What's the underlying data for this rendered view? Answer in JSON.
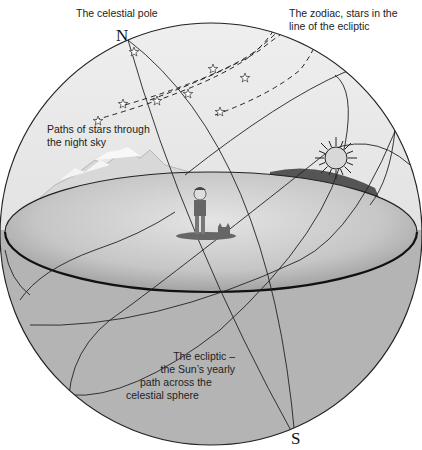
{
  "diagram": {
    "type": "celestial-sphere",
    "labels": {
      "celestial_pole": "The celestial pole",
      "zodiac_line1": "The zodiac, stars in the",
      "zodiac_line2": "line of the ecliptic",
      "star_paths_line1": "Paths of stars through",
      "star_paths_line2": "the night sky",
      "ecliptic_line1": "The ecliptic –",
      "ecliptic_line2": "the Sun’s yearly",
      "ecliptic_line3": "path across the",
      "ecliptic_line4": "celestial sphere"
    },
    "poles": {
      "north": "N",
      "south": "S"
    },
    "icons": [
      "sun-icon",
      "star-icon",
      "person-figure",
      "dog-figure",
      "mountains",
      "trees"
    ],
    "colors": {
      "sky": "#ececec",
      "lower_hemisphere": "#b4b4b4",
      "ground": "#c8c8c8",
      "line": "#222222"
    }
  }
}
